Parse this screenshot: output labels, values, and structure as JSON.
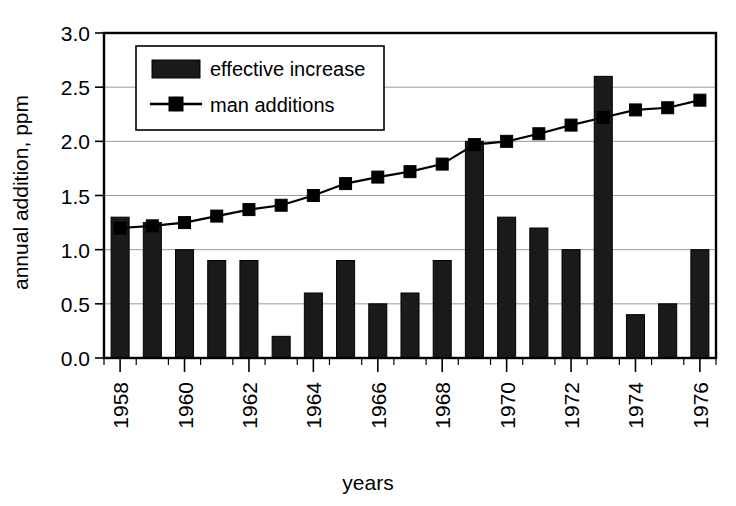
{
  "chart_data": {
    "type": "bar",
    "title": "",
    "xlabel": "years",
    "ylabel": "annual addition, ppm",
    "categories": [
      1958,
      1959,
      1960,
      1961,
      1962,
      1963,
      1964,
      1965,
      1966,
      1967,
      1968,
      1969,
      1970,
      1971,
      1972,
      1973,
      1974,
      1975,
      1976
    ],
    "x_tick_labels": [
      "1958",
      "1960",
      "1962",
      "1964",
      "1966",
      "1968",
      "1970",
      "1972",
      "1974",
      "1976"
    ],
    "x_tick_values": [
      1958,
      1960,
      1962,
      1964,
      1966,
      1968,
      1970,
      1972,
      1974,
      1976
    ],
    "y_tick_labels": [
      "0.0",
      "0.5",
      "1.0",
      "1.5",
      "2.0",
      "2.5",
      "3.0"
    ],
    "y_tick_values": [
      0.0,
      0.5,
      1.0,
      1.5,
      2.0,
      2.5,
      3.0
    ],
    "ylim": [
      0.0,
      3.0
    ],
    "grid": "horizontal",
    "legend_position": "top-left-inside",
    "series": [
      {
        "name": "effective increase",
        "type": "bar",
        "color": "#1a1a1a",
        "values": [
          1.3,
          1.25,
          1.0,
          0.9,
          0.9,
          0.2,
          0.6,
          0.9,
          0.5,
          0.6,
          0.9,
          2.0,
          1.3,
          1.2,
          1.0,
          2.6,
          0.4,
          0.5,
          1.0
        ]
      },
      {
        "name": "man additions",
        "type": "line",
        "color": "#000000",
        "marker": "square",
        "values": [
          1.2,
          1.22,
          1.25,
          1.31,
          1.37,
          1.41,
          1.5,
          1.61,
          1.67,
          1.72,
          1.79,
          1.97,
          2.0,
          2.07,
          2.15,
          2.22,
          2.29,
          2.31,
          2.38
        ]
      }
    ]
  },
  "legend": {
    "entries": [
      {
        "label": "effective increase",
        "marker": "filled-square-swatch"
      },
      {
        "label": "man additions",
        "marker": "line-with-square"
      }
    ]
  },
  "axes": {
    "y_axis_title": "annual addition, ppm",
    "x_axis_title": "years"
  }
}
